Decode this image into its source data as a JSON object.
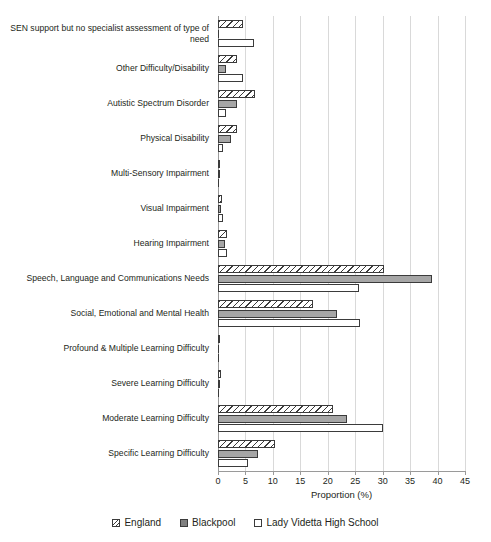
{
  "chart_data": {
    "type": "bar",
    "orientation": "horizontal",
    "title": "",
    "xlabel": "Proportion (%)",
    "ylabel": "",
    "xlim": [
      0,
      45
    ],
    "xticks": [
      0,
      5,
      10,
      15,
      20,
      25,
      30,
      35,
      40,
      45
    ],
    "grid": true,
    "legend_position": "bottom",
    "categories": [
      "SEN support but no specialist assessment of type of need",
      "Other Difficulty/Disability",
      "Autistic Spectrum Disorder",
      "Physical Disability",
      "Multi-Sensory Impairment",
      "Visual Impairment",
      "Hearing Impairment",
      "Speech, Language and Communications Needs",
      "Social, Emotional and Mental Health",
      "Profound & Multiple Learning Difficulty",
      "Severe Learning Difficulty",
      "Moderate Learning Difficulty",
      "Specific Learning Difficulty"
    ],
    "series": [
      {
        "name": "England",
        "color": "#ffffff",
        "pattern": "diagonal-hatch",
        "values": [
          4.5,
          3.4,
          6.8,
          3.4,
          0.2,
          0.7,
          1.6,
          30.3,
          17.3,
          0.3,
          0.5,
          21.0,
          10.4
        ]
      },
      {
        "name": "Blackpool",
        "color": "#a6a6a6",
        "pattern": "solid-grey",
        "values": [
          0.0,
          1.4,
          3.5,
          2.4,
          0.2,
          0.5,
          1.2,
          38.9,
          21.6,
          0.1,
          0.4,
          23.5,
          7.3
        ]
      },
      {
        "name": "Lady Videtta High School",
        "color": "#ffffff",
        "pattern": "light-dotted",
        "values": [
          6.5,
          4.6,
          1.5,
          1.0,
          0.0,
          0.9,
          1.7,
          25.7,
          25.8,
          0.0,
          0.0,
          30.0,
          5.5
        ]
      }
    ]
  },
  "axis": {
    "xlabel": "Proportion (%)",
    "tick_labels": [
      "0",
      "5",
      "10",
      "15",
      "20",
      "25",
      "30",
      "35",
      "40",
      "45"
    ]
  },
  "legend": {
    "items": [
      {
        "label": "England"
      },
      {
        "label": "Blackpool"
      },
      {
        "label": "Lady Videtta High School"
      }
    ]
  }
}
